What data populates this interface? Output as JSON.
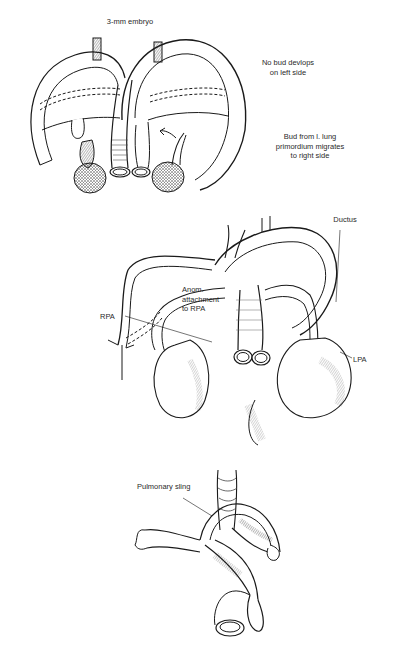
{
  "figure": {
    "panels": [
      {
        "id": "panel-a",
        "labels": {
          "title": "3-mm embryo",
          "left_side": [
            "No bud devlops",
            "on left side"
          ],
          "right_side": [
            "Bud from l. lung",
            "primordium migrates",
            "to right side"
          ]
        }
      },
      {
        "id": "panel-b",
        "labels": {
          "ductus": "Ductus",
          "anomalous": [
            "Anom.",
            "attachment",
            "to RPA"
          ],
          "rpa": "RPA",
          "lpa": "LPA"
        }
      },
      {
        "id": "panel-c",
        "labels": {
          "sling": "Pulmonary sling"
        }
      }
    ],
    "caption": {
      "visible": "partially cut off",
      "text": ""
    },
    "colors": {
      "ink": "#1a1a1a",
      "background": "#ffffff"
    }
  }
}
